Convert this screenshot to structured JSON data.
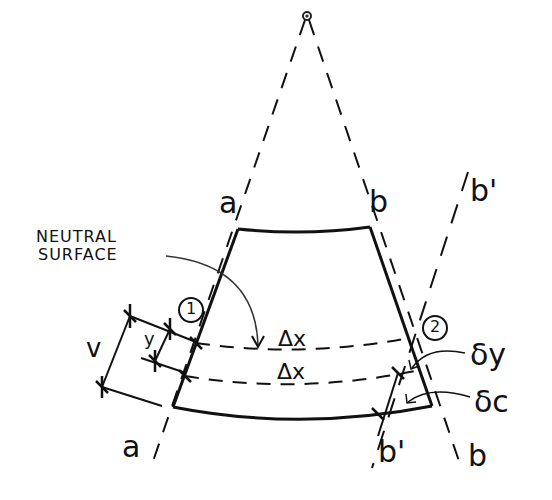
{
  "diagram": {
    "type": "beam bending segment (hand sketch)",
    "labels": {
      "a_top": "a",
      "b_top": "b",
      "b_prime_top": "b'",
      "a_bottom": "a",
      "b_prime_bottom": "b'",
      "b_bottom": "b",
      "neutral_surface_line1": "NEUTRAL",
      "neutral_surface_line2": "SURFACE",
      "point_1": "1",
      "point_2": "2",
      "dx_top": "Δx",
      "dx_bottom": "Δx",
      "dim_v": "v",
      "dim_y": "y",
      "delta_y": "δy",
      "delta_c": "δc"
    },
    "colors": {
      "ink": "#111111",
      "background": "#ffffff"
    }
  }
}
